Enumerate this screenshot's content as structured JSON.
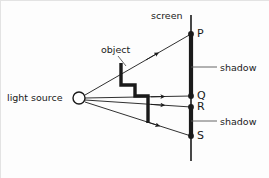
{
  "figure": {
    "labels": {
      "light_source": "light source",
      "object": "object",
      "screen": "screen",
      "shadow_top": "shadow",
      "shadow_bottom": "shadow",
      "point_p": "P",
      "point_q": "Q",
      "point_r": "R",
      "point_s": "S"
    },
    "colors": {
      "ink": "#1a1a1a",
      "leader": "#555555",
      "background": "#fdfdfd"
    },
    "geometry": {
      "light_source": {
        "x": 78,
        "y": 97,
        "radius": 6
      },
      "screen": {
        "x": 190,
        "y_top": 14,
        "y_bottom": 160
      },
      "points": [
        {
          "name": "P",
          "x": 190,
          "y": 33
        },
        {
          "name": "Q",
          "x": 190,
          "y": 95
        },
        {
          "name": "R",
          "x": 190,
          "y": 106
        },
        {
          "name": "S",
          "x": 190,
          "y": 135
        }
      ],
      "shadow_segments": [
        {
          "from": "P",
          "to": "Q"
        },
        {
          "from": "R",
          "to": "S"
        }
      ],
      "object_outline": "M 120,62 L 120,84 L 134,84 L 134,95 L 147,95 L 147,122",
      "rays": [
        {
          "name": "ray-to-P",
          "x1": 84,
          "y1": 94,
          "x2": 190,
          "y2": 33,
          "arrow_t": 0.62
        },
        {
          "name": "ray-to-Q",
          "x1": 84,
          "y1": 97,
          "x2": 190,
          "y2": 95,
          "arrow_t": 0.68
        },
        {
          "name": "ray-to-R",
          "x1": 84,
          "y1": 99,
          "x2": 190,
          "y2": 106,
          "arrow_t": 0.68
        },
        {
          "name": "ray-to-S",
          "x1": 84,
          "y1": 101,
          "x2": 190,
          "y2": 135,
          "arrow_t": 0.66
        }
      ],
      "leaders": [
        {
          "name": "object-leader",
          "x1": 117,
          "y1": 55,
          "x2": 124,
          "y2": 64
        },
        {
          "name": "shadow-top-leader",
          "x1": 190,
          "y1": 66,
          "x2": 215,
          "y2": 66
        },
        {
          "name": "shadow-bottom-leader",
          "x1": 190,
          "y1": 120,
          "x2": 215,
          "y2": 120
        }
      ]
    }
  }
}
